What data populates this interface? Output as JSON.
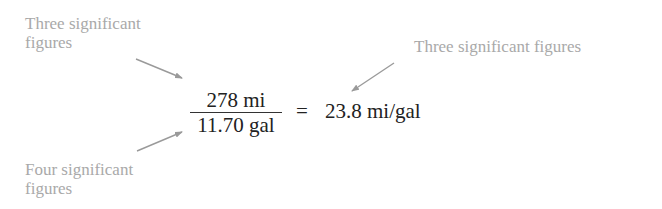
{
  "annotations": {
    "top_left": {
      "line1": "Three significant",
      "line2": "figures",
      "points_to": "numerator"
    },
    "bottom_left": {
      "line1": "Four significant",
      "line2": "figures",
      "points_to": "denominator"
    },
    "top_right": {
      "line1": "Three significant figures",
      "points_to": "result"
    }
  },
  "equation": {
    "numerator": "278 mi",
    "denominator": "11.70 gal",
    "operator": "=",
    "result": "23.8 mi/gal"
  },
  "colors": {
    "annotation_text": "#a9a9a9",
    "arrow": "#9a9a9a",
    "equation_text": "#222222",
    "background": "#ffffff"
  }
}
